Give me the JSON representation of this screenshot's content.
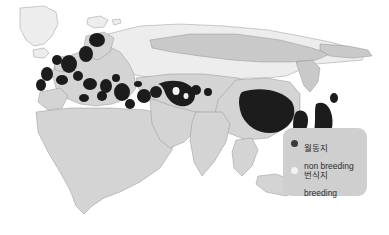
{
  "map": {
    "title": "",
    "projection_region": "Eurasia, North Africa, Greenland",
    "ocean_color": "#ffffff",
    "land_color": "#d4d4d4",
    "land_light_color": "#ededed",
    "border_color": "#8c8c8c",
    "nonbreeding_color": "#1c1c1c",
    "breeding_color": "#c9c9c9",
    "regions": [
      {
        "name": "greenland",
        "fill_type": "land_light"
      },
      {
        "name": "iceland",
        "fill_type": "land_light"
      },
      {
        "name": "svalbard",
        "fill_type": "land_light"
      },
      {
        "name": "europe",
        "fill_type": "land"
      },
      {
        "name": "north-africa",
        "fill_type": "land"
      },
      {
        "name": "siberia-breeding-band",
        "fill_type": "breeding"
      },
      {
        "name": "central-asia",
        "fill_type": "land"
      },
      {
        "name": "south-asia",
        "fill_type": "land"
      },
      {
        "name": "east-asia",
        "fill_type": "land"
      },
      {
        "name": "southeast-asia",
        "fill_type": "land"
      },
      {
        "name": "japan",
        "fill_type": "nonbreeding"
      },
      {
        "name": "korea",
        "fill_type": "nonbreeding"
      },
      {
        "name": "eastern-china",
        "fill_type": "nonbreeding"
      }
    ]
  },
  "legend": {
    "background_color": "#cfcfcf",
    "items": [
      {
        "marker": "filled-dark-circle",
        "marker_color": "#3a3a3a",
        "label_ko": "월동지",
        "label_en": "non breeding"
      },
      {
        "marker": "filled-light-circle",
        "marker_color": "#f2f2f2",
        "label_ko": "번식지",
        "label_en": "breeding"
      }
    ]
  }
}
